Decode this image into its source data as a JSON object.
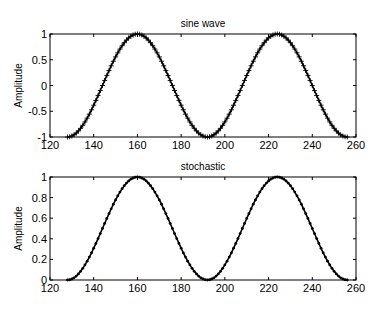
{
  "chart_data": [
    {
      "type": "line",
      "title": "sine wave",
      "xlabel": "",
      "ylabel": "Amplitude",
      "xlim": [
        120,
        260
      ],
      "ylim": [
        -1,
        1
      ],
      "xticks": [
        120,
        140,
        160,
        180,
        200,
        220,
        240,
        260
      ],
      "yticks": [
        -1,
        -0.5,
        0,
        0.5,
        1
      ],
      "ytick_labels": [
        "-1",
        "-0.5",
        "0",
        "0.5",
        "1"
      ],
      "marker": "+",
      "x_range": [
        128,
        256
      ],
      "formula": "y = -cos(2*pi*(x-128)/64)",
      "x": [
        128,
        136,
        144,
        152,
        160,
        168,
        176,
        184,
        192,
        200,
        208,
        216,
        224,
        232,
        240,
        248,
        256
      ],
      "values": [
        -1,
        -0.71,
        0,
        0.71,
        1,
        0.71,
        0,
        -0.71,
        -1,
        -0.71,
        0,
        0.71,
        1,
        0.71,
        0,
        -0.71,
        -1
      ],
      "grid": false,
      "color": "#000000"
    },
    {
      "type": "line",
      "title": "stochastic",
      "xlabel": "",
      "ylabel": "Amplitude",
      "xlim": [
        120,
        260
      ],
      "ylim": [
        0,
        1
      ],
      "xticks": [
        120,
        140,
        160,
        180,
        200,
        220,
        240,
        260
      ],
      "yticks": [
        0,
        0.2,
        0.4,
        0.6,
        0.8,
        1
      ],
      "ytick_labels": [
        "0",
        "0.2",
        "0.4",
        "0.6",
        "0.8",
        "1"
      ],
      "marker": ".",
      "x_range": [
        128,
        256
      ],
      "formula": "y = (1 - cos(2*pi*(x-128)/64)) / 2",
      "x": [
        128,
        136,
        144,
        152,
        160,
        168,
        176,
        184,
        192,
        200,
        208,
        216,
        224,
        232,
        240,
        248,
        256
      ],
      "values": [
        0,
        0.15,
        0.5,
        0.85,
        1,
        0.85,
        0.5,
        0.15,
        0,
        0.15,
        0.5,
        0.85,
        1,
        0.85,
        0.5,
        0.15,
        0
      ],
      "grid": false,
      "color": "#000000"
    }
  ],
  "plots": {
    "top": {
      "title": "sine wave",
      "ylabel": "Amplitude"
    },
    "bottom": {
      "title": "stochastic",
      "ylabel": "Amplitude"
    }
  }
}
